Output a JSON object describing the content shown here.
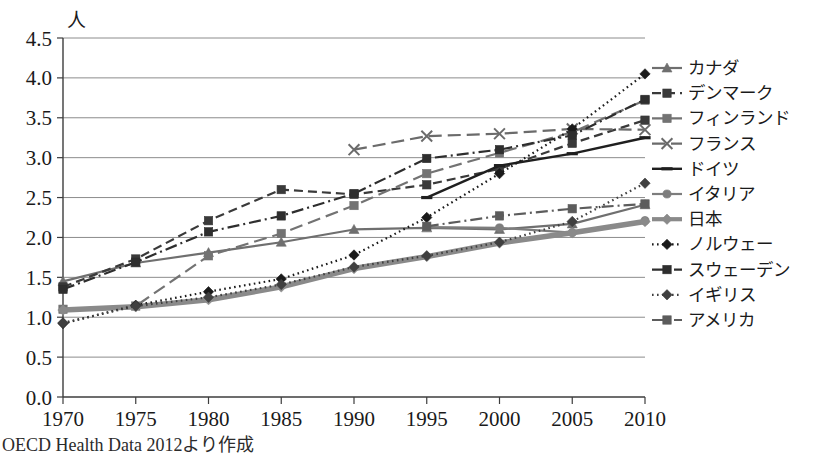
{
  "figure": {
    "y_axis_unit": "人",
    "source_note": "OECD Health Data 2012より作成"
  },
  "chart_data": {
    "type": "line",
    "title": "",
    "xlabel": "",
    "ylabel": "人",
    "x": [
      1970,
      1975,
      1980,
      1985,
      1990,
      1995,
      2000,
      2005,
      2010
    ],
    "xlim": [
      1970,
      2010
    ],
    "ylim": [
      0.0,
      4.5
    ],
    "y_ticks": [
      0.0,
      0.5,
      1.0,
      1.5,
      2.0,
      2.5,
      3.0,
      3.5,
      4.0,
      4.5
    ],
    "y_tick_labels": [
      "0.0",
      "0.5",
      "1.0",
      "1.5",
      "2.0",
      "2.5",
      "3.0",
      "3.5",
      "4.0",
      "4.5"
    ],
    "x_tick_labels": [
      "1970",
      "1975",
      "1980",
      "1985",
      "1990",
      "1995",
      "2000",
      "2005",
      "2010"
    ],
    "grid": "horizontal",
    "legend_position": "right",
    "series": [
      {
        "name": "カナダ",
        "color": "#6f6f6f",
        "dash": "none",
        "marker": "triangle",
        "width": 2.2,
        "values": [
          1.45,
          1.68,
          1.81,
          1.94,
          2.1,
          2.12,
          2.1,
          2.17,
          2.41
        ]
      },
      {
        "name": "デンマーク",
        "color": "#3a3a3a",
        "dash": "dash",
        "marker": "square",
        "width": 2.2,
        "values": [
          1.38,
          1.73,
          2.21,
          2.6,
          2.54,
          2.66,
          2.86,
          3.18,
          3.47
        ]
      },
      {
        "name": "フィンランド",
        "color": "#737373",
        "dash": "longdash",
        "marker": "square",
        "width": 2.2,
        "values": [
          1.1,
          1.14,
          1.77,
          2.05,
          2.4,
          2.8,
          3.06,
          3.32,
          3.72
        ]
      },
      {
        "name": "フランス",
        "color": "#6b6b6b",
        "dash": "longdash",
        "marker": "cross",
        "width": 2.2,
        "values": [
          null,
          null,
          null,
          null,
          3.1,
          3.27,
          3.3,
          3.36,
          3.35
        ]
      },
      {
        "name": "ドイツ",
        "color": "#1f1f1f",
        "dash": "none",
        "marker": "dash",
        "width": 2.4,
        "values": [
          null,
          null,
          null,
          null,
          null,
          2.5,
          2.9,
          3.05,
          3.25
        ]
      },
      {
        "name": "イタリア",
        "color": "#7d7d7d",
        "dash": "none",
        "marker": "circle",
        "width": 2.2,
        "values": [
          null,
          null,
          null,
          null,
          null,
          2.13,
          2.12,
          2.06,
          2.21
        ]
      },
      {
        "name": "日本",
        "color": "#8a8a8a",
        "dash": "none",
        "marker": "diamond",
        "width": 5.5,
        "values": [
          1.09,
          1.13,
          1.22,
          1.38,
          1.61,
          1.76,
          1.93,
          2.06,
          2.2
        ]
      },
      {
        "name": "ノルウェー",
        "color": "#1a1a1a",
        "dash": "dot",
        "marker": "diamond",
        "width": 2.2,
        "values": [
          0.92,
          1.15,
          1.32,
          1.48,
          1.78,
          2.25,
          2.8,
          3.36,
          4.05
        ]
      },
      {
        "name": "スウェーデン",
        "color": "#2e2e2e",
        "dash": "dashdot",
        "marker": "square",
        "width": 2.2,
        "values": [
          1.35,
          1.69,
          2.07,
          2.27,
          2.55,
          2.99,
          3.1,
          3.28,
          3.73
        ]
      },
      {
        "name": "イギリス",
        "color": "#404040",
        "dash": "dot",
        "marker": "diamond",
        "width": 2.2,
        "values": [
          0.93,
          1.14,
          1.25,
          1.41,
          1.63,
          1.77,
          1.94,
          2.2,
          2.68
        ]
      },
      {
        "name": "アメリカ",
        "color": "#5c5c5c",
        "dash": "dashdot",
        "marker": "square",
        "width": 2.2,
        "values": [
          null,
          null,
          null,
          null,
          null,
          2.14,
          2.27,
          2.36,
          2.42
        ]
      }
    ]
  },
  "legend": {
    "items": [
      {
        "label": "カナダ"
      },
      {
        "label": "デンマーク"
      },
      {
        "label": "フィンランド"
      },
      {
        "label": "フランス"
      },
      {
        "label": "ドイツ"
      },
      {
        "label": "イタリア"
      },
      {
        "label": "日本"
      },
      {
        "label": "ノルウェー"
      },
      {
        "label": "スウェーデン"
      },
      {
        "label": "イギリス"
      },
      {
        "label": "アメリカ"
      }
    ]
  }
}
